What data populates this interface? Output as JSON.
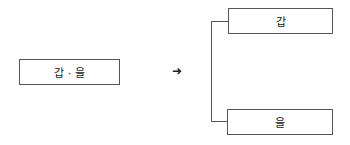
{
  "diagram": {
    "source_box": {
      "label": "갑 · 을"
    },
    "arrow": {
      "icon": "right-arrow-icon",
      "glyph": "➜"
    },
    "targets": [
      {
        "label": "갑"
      },
      {
        "label": "을"
      }
    ],
    "colors": {
      "border": "#555555",
      "text": "#222222",
      "background": "#ffffff"
    }
  }
}
